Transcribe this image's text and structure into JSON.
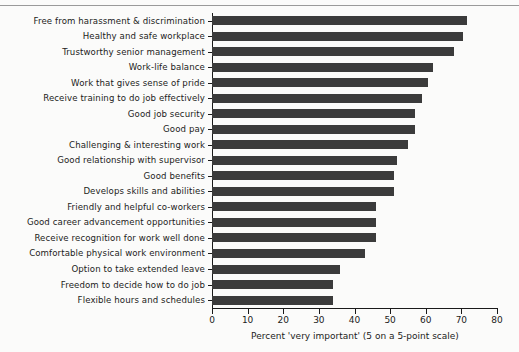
{
  "chart_data": {
    "type": "bar",
    "orientation": "horizontal",
    "title": "",
    "subtitle": "",
    "xlabel": "Percent 'very important' (5 on a 5-point scale)",
    "ylabel": "",
    "xlim": [
      0,
      80
    ],
    "xticks": [
      0,
      10,
      20,
      30,
      40,
      50,
      60,
      70,
      80
    ],
    "xticklabels": [
      "0",
      "10",
      "20",
      "30",
      "40",
      "50",
      "60",
      "70",
      "80"
    ],
    "grid": false,
    "legend": null,
    "bar_color": "#3b3b3b",
    "categories": [
      "Free from harassment & discrimination",
      "Healthy and safe workplace",
      "Trustworthy senior management",
      "Work-life balance",
      "Work that gives sense of pride",
      "Receive training to do job effectively",
      "Good job security",
      "Good pay",
      "Challenging & interesting work",
      "Good relationship with supervisor",
      "Good benefits",
      "Develops skills and abilities",
      "Friendly and helpful co-workers",
      "Good career advancement opportunities",
      "Receive recognition for work well done",
      "Comfortable physical work environment",
      "Option to take extended leave",
      "Freedom to decide how to do job",
      "Flexible hours and schedules"
    ],
    "values": [
      71.5,
      70.5,
      68,
      62,
      60.5,
      59,
      57,
      57,
      55,
      52,
      51,
      51,
      46,
      46,
      46,
      43,
      36,
      34,
      34
    ]
  },
  "figure": {
    "background_color": "#fbfbfa",
    "axis_color": "#1a1a1a",
    "rule_color": "#9a9a9a"
  }
}
